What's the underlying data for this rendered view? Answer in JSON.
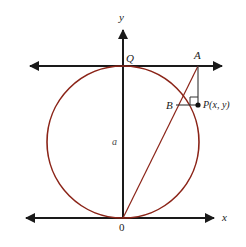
{
  "figure": {
    "type": "geometry-diagram",
    "colors": {
      "curve": "#8B2418",
      "axis": "#1a1a1a",
      "construction": "#333333",
      "background": "#ffffff"
    },
    "axes": {
      "y_label": "y",
      "x_label": "x",
      "origin_label": "0"
    },
    "labels": {
      "q": "Q",
      "a": "a",
      "big_a": "A",
      "b": "B",
      "p": "P(x, y)"
    },
    "geometry": {
      "circle": {
        "cx": 123,
        "cy": 142,
        "r": 76
      },
      "origin": {
        "x": 123,
        "y": 218
      },
      "point_q": {
        "x": 123,
        "y": 66
      },
      "point_a": {
        "x": 198,
        "y": 66
      },
      "point_b": {
        "x": 178,
        "y": 105
      },
      "point_p": {
        "x": 198,
        "y": 105
      },
      "upper_line_y": 66,
      "x_axis_y": 218,
      "y_axis_x": 123
    }
  }
}
